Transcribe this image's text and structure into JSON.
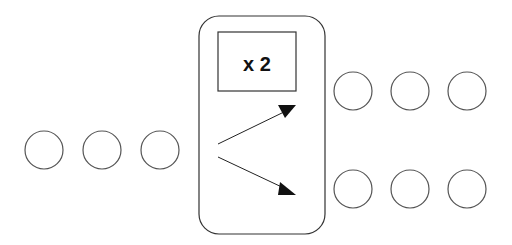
{
  "diagram": {
    "box_label": "x 2",
    "stroke_color": "#555555",
    "input_circles": [
      {
        "cx": 44,
        "cy": 150
      },
      {
        "cx": 102,
        "cy": 150
      },
      {
        "cx": 160,
        "cy": 150
      }
    ],
    "output_top_circles": [
      {
        "cx": 353,
        "cy": 91
      },
      {
        "cx": 410,
        "cy": 91
      },
      {
        "cx": 467,
        "cy": 91
      }
    ],
    "output_bottom_circles": [
      {
        "cx": 353,
        "cy": 189
      },
      {
        "cx": 410,
        "cy": 189
      },
      {
        "cx": 467,
        "cy": 189
      }
    ],
    "circle_radius": 19
  }
}
